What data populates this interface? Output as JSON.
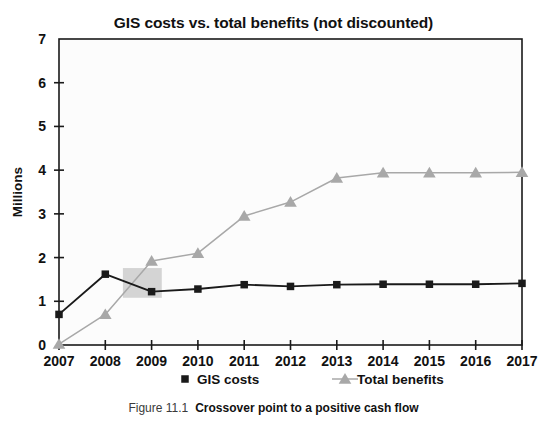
{
  "chart_data": {
    "type": "line",
    "title": "GIS costs vs. total benefits (not discounted)",
    "xlabel": "",
    "ylabel": "Millions",
    "categories": [
      "2007",
      "2008",
      "2009",
      "2010",
      "2011",
      "2012",
      "2013",
      "2014",
      "2015",
      "2016",
      "2017"
    ],
    "series": [
      {
        "name": "GIS costs",
        "color": "#1a1a1a",
        "marker": "square",
        "values": [
          0.7,
          1.62,
          1.22,
          1.28,
          1.38,
          1.34,
          1.38,
          1.39,
          1.39,
          1.39,
          1.41
        ]
      },
      {
        "name": "Total benefits",
        "color": "#a8a8a8",
        "marker": "triangle",
        "values": [
          0.02,
          0.7,
          1.92,
          2.1,
          2.95,
          3.27,
          3.82,
          3.94,
          3.94,
          3.94,
          3.95
        ]
      }
    ],
    "ylim": [
      0,
      7
    ],
    "yticks": [
      0,
      1,
      2,
      3,
      4,
      5,
      6,
      7
    ],
    "ytick_labels": [
      "0",
      "1",
      "2",
      "3",
      "4",
      "5",
      "6",
      "7"
    ],
    "grid": false,
    "legend_position": "bottom",
    "annotations": [
      {
        "name": "crossover-highlight",
        "type": "rect",
        "x_start": 2008.38,
        "x_end": 2009.22,
        "y_start": 1.08,
        "y_end": 1.76,
        "color": "#d4d4d4"
      }
    ],
    "plot_background": "#fcfcfc",
    "plot_border_color": "#1a1a1a"
  },
  "caption": {
    "number": "Figure 11.1",
    "text": "Crossover point to a positive cash flow"
  }
}
